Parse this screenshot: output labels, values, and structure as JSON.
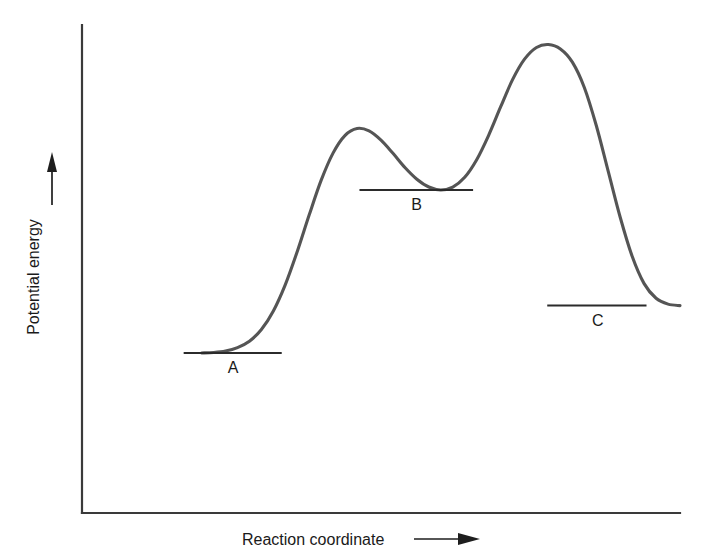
{
  "figure": {
    "background_color": "#ffffff",
    "curve_color": "#555555",
    "axis_color": "#3a3a3a",
    "text_color": "#1a1a1a"
  },
  "axes": {
    "y_axis_label": "Potential energy",
    "y_axis_arrow": "up-arrow",
    "x_axis_label": "Reaction coordinate",
    "x_axis_arrow": "right-arrow"
  },
  "levels": [
    {
      "label": "A",
      "name": "reactant-level"
    },
    {
      "label": "B",
      "name": "intermediate-level"
    },
    {
      "label": "C",
      "name": "product-level"
    }
  ],
  "chart_data": {
    "type": "line",
    "title": "",
    "xlabel": "Reaction coordinate",
    "ylabel": "Potential energy",
    "xlim": [
      0,
      100
    ],
    "ylim": [
      0,
      100
    ],
    "grid": false,
    "legend": null,
    "axis_ticks": {
      "x": [],
      "y": []
    },
    "series": [
      {
        "name": "potential-energy-profile",
        "color": "#555555",
        "x": [
          20.0,
          22.0,
          24.0,
          26.0,
          28.0,
          30.0,
          32.0,
          34.0,
          36.0,
          38.0,
          40.0,
          42.0,
          44.0,
          46.0,
          48.0,
          50.0,
          52.0,
          54.0,
          56.0,
          58.0,
          60.0,
          62.0,
          64.0,
          66.0,
          68.0,
          70.0,
          72.0,
          74.0,
          76.0,
          78.0,
          80.0,
          82.0,
          84.0,
          86.0,
          88.0,
          90.0,
          92.0,
          94.0,
          96.0,
          98.0,
          100.0
        ],
        "y": [
          32.8,
          32.9,
          33.2,
          33.9,
          35.2,
          37.6,
          41.4,
          46.8,
          53.6,
          61.1,
          68.2,
          73.8,
          77.4,
          78.8,
          78.3,
          76.4,
          73.7,
          70.8,
          68.4,
          66.8,
          66.2,
          66.8,
          68.8,
          72.4,
          77.4,
          83.2,
          88.8,
          93.0,
          95.4,
          96.0,
          95.1,
          92.4,
          87.2,
          79.4,
          70.0,
          60.6,
          52.6,
          47.0,
          44.0,
          42.8,
          42.5
        ]
      }
    ],
    "annotations": [
      {
        "label": "A",
        "name": "reactant-level",
        "type": "energy-level-line",
        "energy": 32.8,
        "x_start": 17.0,
        "x_end": 33.4,
        "label_position": "below"
      },
      {
        "label": "B",
        "name": "intermediate-level",
        "type": "energy-level-line",
        "energy": 66.2,
        "x_start": 46.4,
        "x_end": 65.4,
        "label_position": "below"
      },
      {
        "label": "C",
        "name": "product-level",
        "type": "energy-level-line",
        "energy": 42.5,
        "x_start": 77.8,
        "x_end": 94.4,
        "label_position": "below"
      }
    ]
  }
}
